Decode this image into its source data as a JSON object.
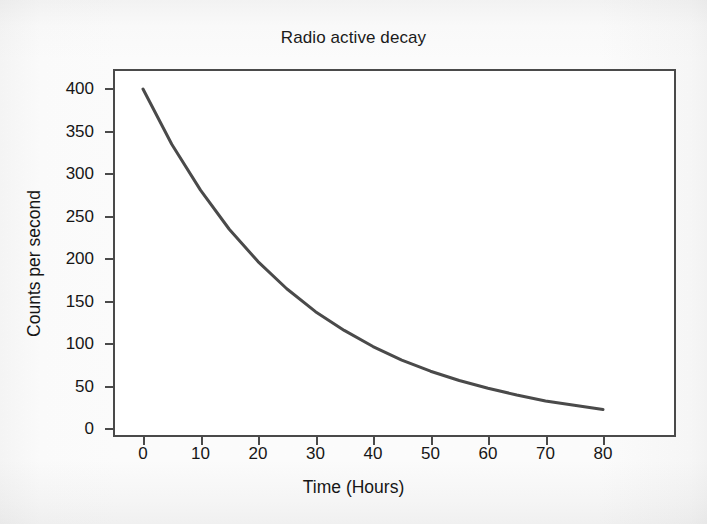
{
  "chart_data": {
    "type": "line",
    "title": "Radio active decay",
    "xlabel": "Time (Hours)",
    "ylabel": "Counts per second",
    "xlim": [
      -5,
      85
    ],
    "ylim": [
      0,
      425
    ],
    "xticks": [
      0,
      10,
      20,
      30,
      40,
      50,
      60,
      70,
      80
    ],
    "yticks": [
      0,
      50,
      100,
      150,
      200,
      250,
      300,
      350,
      400
    ],
    "grid": false,
    "legend": null,
    "series": [
      {
        "name": "Counts per second",
        "color": "#4a4a4a",
        "x": [
          0,
          5,
          10,
          15,
          20,
          25,
          30,
          35,
          40,
          45,
          50,
          55,
          60,
          65,
          70,
          75,
          80
        ],
        "values": [
          400,
          335,
          281,
          235,
          197,
          165,
          138,
          116,
          97,
          81,
          68,
          57,
          48,
          40,
          33,
          28,
          23
        ]
      }
    ],
    "annotations": []
  },
  "figure": {
    "title": "Radio active decay",
    "axis_titles": {
      "x": "Time (Hours)",
      "y": "Counts per second"
    },
    "x_tick_labels": [
      "0",
      "10",
      "20",
      "30",
      "40",
      "50",
      "60",
      "70",
      "80"
    ],
    "y_tick_labels": [
      "0",
      "50",
      "100",
      "150",
      "200",
      "250",
      "300",
      "350",
      "400"
    ],
    "colors": {
      "curve": "#4a4a4a",
      "frame": "#4a4a4a",
      "text": "#161616",
      "plot_background": "#ffffff",
      "page_background": "#fdfdfd"
    }
  }
}
